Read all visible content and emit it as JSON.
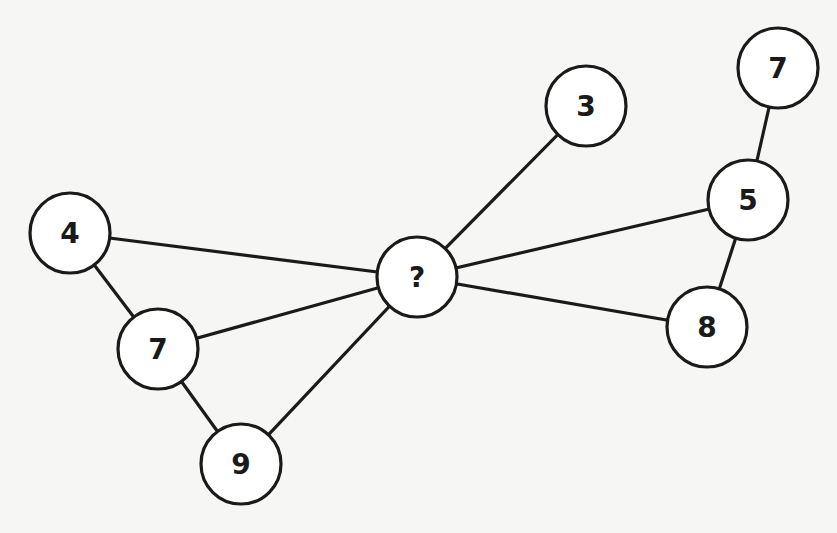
{
  "diagram": {
    "type": "number-graph-puzzle",
    "nodes": [
      {
        "id": "center",
        "label": "?",
        "x": 417,
        "y": 277
      },
      {
        "id": "n3",
        "label": "3",
        "x": 586,
        "y": 106
      },
      {
        "id": "n7top",
        "label": "7",
        "x": 778,
        "y": 68
      },
      {
        "id": "n5",
        "label": "5",
        "x": 748,
        "y": 200
      },
      {
        "id": "n8",
        "label": "8",
        "x": 707,
        "y": 327
      },
      {
        "id": "n4",
        "label": "4",
        "x": 70,
        "y": 233
      },
      {
        "id": "n7left",
        "label": "7",
        "x": 158,
        "y": 349
      },
      {
        "id": "n9",
        "label": "9",
        "x": 241,
        "y": 464
      }
    ],
    "edges": [
      [
        "center",
        "n3"
      ],
      [
        "center",
        "n5"
      ],
      [
        "center",
        "n8"
      ],
      [
        "center",
        "n4"
      ],
      [
        "center",
        "n7left"
      ],
      [
        "center",
        "n9"
      ],
      [
        "n7top",
        "n5"
      ],
      [
        "n5",
        "n8"
      ],
      [
        "n4",
        "n7left"
      ],
      [
        "n7left",
        "n9"
      ]
    ],
    "node_radius": 40,
    "stroke_color": "#1a1a1a",
    "fill_color": "#ffffff"
  }
}
